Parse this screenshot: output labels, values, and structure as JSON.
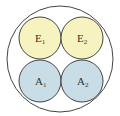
{
  "diagram": {
    "outer": {
      "cx": 60,
      "cy": 59,
      "r": 53,
      "stroke": "#444444",
      "fill": "#ffffff"
    },
    "circles": [
      {
        "id": "E1",
        "base": "E",
        "sub": "1",
        "cx": 40,
        "cy": 38,
        "r": 21,
        "fill": "#f7f3c0"
      },
      {
        "id": "E2",
        "base": "E",
        "sub": "2",
        "cx": 82,
        "cy": 38,
        "r": 21,
        "fill": "#f7f3c0"
      },
      {
        "id": "A1",
        "base": "A",
        "sub": "1",
        "cx": 40,
        "cy": 81,
        "r": 21,
        "fill": "#c9dde6"
      },
      {
        "id": "A2",
        "base": "A",
        "sub": "2",
        "cx": 82,
        "cy": 81,
        "r": 21,
        "fill": "#c9dde6"
      }
    ],
    "stroke": "#444444"
  }
}
